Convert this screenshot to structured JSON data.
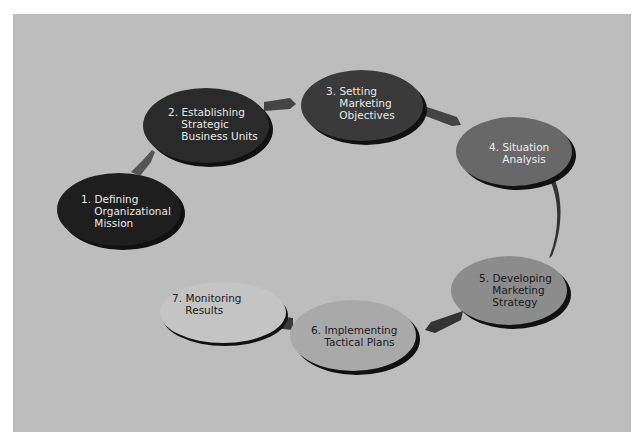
{
  "diagram": {
    "type": "cycle-process",
    "background_color": "#bdbdbd",
    "steps": [
      {
        "number": "1.",
        "line1": "Defining",
        "line2": "Organizational",
        "line3": "Mission",
        "fill": "#1e1e1e",
        "text_color": "#e8e8e8"
      },
      {
        "number": "2.",
        "line1": "Establishing",
        "line2": "Strategic",
        "line3": "Business Units",
        "fill": "#2a2a2a",
        "text_color": "#e8e8e8"
      },
      {
        "number": "3.",
        "line1": "Setting",
        "line2": "Marketing",
        "line3": "Objectives",
        "fill": "#3a3a3a",
        "text_color": "#e8e8e8"
      },
      {
        "number": "4.",
        "line1": "Situation",
        "line2": "Analysis",
        "line3": "",
        "fill": "#686868",
        "text_color": "#eeeeee"
      },
      {
        "number": "5.",
        "line1": "Developing",
        "line2": "Marketing",
        "line3": "Strategy",
        "fill": "#8c8c8c",
        "text_color": "#1a1a1a"
      },
      {
        "number": "6.",
        "line1": "Implementing",
        "line2": "Tactical Plans",
        "line3": "",
        "fill": "#a9a9a9",
        "text_color": "#1a1a1a"
      },
      {
        "number": "7.",
        "line1": "Monitoring",
        "line2": "Results",
        "line3": "",
        "fill": "#c4c4c4",
        "text_color": "#1a1a1a"
      }
    ],
    "connections": [
      {
        "from": 1,
        "to": 2
      },
      {
        "from": 2,
        "to": 3
      },
      {
        "from": 3,
        "to": 4
      },
      {
        "from": 4,
        "to": 5
      },
      {
        "from": 5,
        "to": 6
      },
      {
        "from": 6,
        "to": 7
      }
    ]
  }
}
